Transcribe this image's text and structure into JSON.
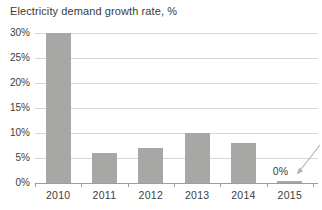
{
  "chart_data": {
    "type": "bar",
    "title": "Electricity demand growth rate, %",
    "categories": [
      "2010",
      "2011",
      "2012",
      "2013",
      "2014",
      "2015"
    ],
    "values": [
      30,
      6,
      7,
      10,
      8,
      0.3
    ],
    "xlabel": "",
    "ylabel": "",
    "ylim": [
      0,
      30
    ],
    "yticks": [
      30,
      25,
      20,
      15,
      10,
      5,
      0
    ],
    "ytick_labels": [
      "30%",
      "25%",
      "20%",
      "15%",
      "10%",
      "5%",
      "0%"
    ],
    "grid": true,
    "legend": "none",
    "annotation": {
      "label": "0%",
      "category": "2015"
    },
    "colors": {
      "bar": "#a7a7a5",
      "gridline": "#d7d7d5",
      "axis": "#9c9c9a",
      "text": "#3d3d3d",
      "arrow": "#b3b3b1",
      "background": "#ffffff"
    }
  }
}
